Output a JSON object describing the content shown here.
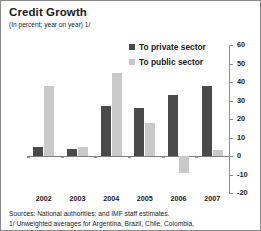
{
  "chart_data": {
    "type": "bar",
    "title": "Credit Growth",
    "subtitle": "(In percent; year on year) 1/",
    "categories": [
      "2002",
      "2003",
      "2004",
      "2005",
      "2006",
      "2007"
    ],
    "series": [
      {
        "name": "To private sector",
        "color": "#4a4a4a",
        "values": [
          5,
          4,
          27,
          26,
          33,
          38
        ]
      },
      {
        "name": "To public sector",
        "color": "#c9c9c9",
        "values": [
          38,
          5,
          45,
          18,
          -9,
          3
        ]
      }
    ],
    "xlabel": "",
    "ylabel": "",
    "ylim": [
      -20,
      60
    ],
    "yticks": [
      60,
      50,
      40,
      30,
      20,
      10,
      0,
      -10,
      -20
    ],
    "ytick_labels": [
      "60",
      "50",
      "40",
      "30",
      "20",
      "10",
      "0",
      "-10",
      "-20"
    ],
    "grid": false,
    "axis_position": "right",
    "legend_position": "top-right",
    "zero_line": 0
  },
  "notes": [
    "Sources: National authorities; and IMF staff estimates.",
    "1/ Unweighted averages for  Argentina, Brazil, Chile, Colombia,"
  ]
}
